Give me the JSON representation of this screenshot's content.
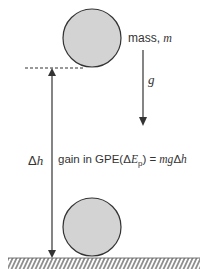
{
  "labels": {
    "mass": "mass, ",
    "mass_symbol": "m",
    "g": "g",
    "delta_h_delta": "Δ",
    "delta_h_h": "h",
    "gpe_prefix": "gain in GPE(Δ",
    "gpe_E": "E",
    "gpe_sub": "p",
    "gpe_eq": ") = ",
    "gpe_formula_mg": "mg",
    "gpe_formula_delta": "Δ",
    "gpe_formula_h": "h"
  },
  "colors": {
    "ball_fill": "#d3d3d3",
    "stroke": "#333333",
    "text": "#333333"
  }
}
